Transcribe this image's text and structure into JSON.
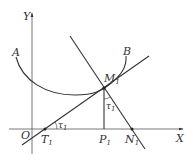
{
  "diagram": {
    "type": "geometry",
    "colors": {
      "stroke": "#333333",
      "background": "#ffffff"
    },
    "axes": {
      "x_label": "X",
      "y_label": "Y",
      "origin_label": "O"
    },
    "curve": {
      "start_label": "A",
      "end_label": "B"
    },
    "points": {
      "M": {
        "label": "M",
        "sub": "1"
      },
      "T": {
        "label": "T",
        "sub": "1"
      },
      "P": {
        "label": "P",
        "sub": "1"
      },
      "N": {
        "label": "N",
        "sub": "1"
      }
    },
    "angles": [
      {
        "label": "τ",
        "sub": "1",
        "location": "at T1 between tangent and X axis"
      },
      {
        "label": "τ",
        "sub": "1",
        "location": "at M1 between M1P1 and normal"
      }
    ],
    "lines": [
      {
        "name": "tangent",
        "through": [
          "T1",
          "M1"
        ]
      },
      {
        "name": "normal",
        "through": [
          "M1",
          "N1"
        ]
      },
      {
        "name": "ordinate",
        "through": [
          "M1",
          "P1"
        ]
      }
    ]
  }
}
